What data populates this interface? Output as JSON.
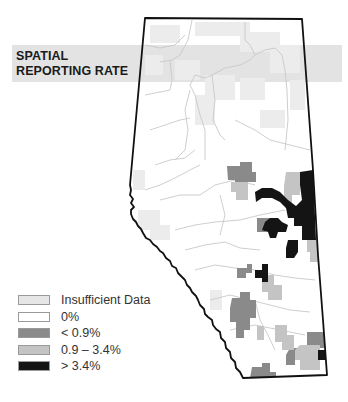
{
  "title": {
    "line1": "SPATIAL",
    "line2": "REPORTING RATE"
  },
  "map": {
    "region": "Alberta",
    "border_color": "#111111",
    "river_color": "#c8c8c8"
  },
  "legend": {
    "items": [
      {
        "label": "Insufficient Data",
        "color": "#e6e6e6"
      },
      {
        "label": "0%",
        "color": "#ffffff"
      },
      {
        "label": "< 0.9%",
        "color": "#8a8a8a"
      },
      {
        "label": "0.9 – 3.4%",
        "color": "#c4c4c4"
      },
      {
        "label": "> 3.4%",
        "color": "#141414"
      }
    ]
  }
}
